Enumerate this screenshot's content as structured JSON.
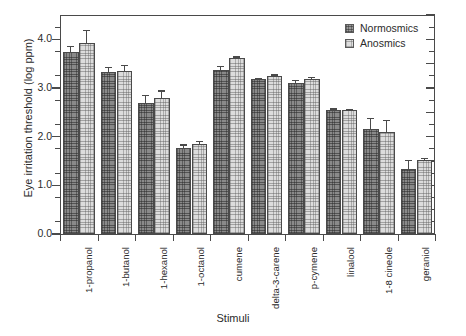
{
  "chart_data": {
    "type": "bar",
    "title": "",
    "xlabel": "Stimuli",
    "ylabel": "Eye irritation threshold (log ppm)",
    "ylim": [
      0.0,
      4.5
    ],
    "yticks": [
      "0.0",
      "1.0",
      "2.0",
      "3.0",
      "4.0"
    ],
    "ytick_values": [
      0.0,
      1.0,
      2.0,
      3.0,
      4.0
    ],
    "grid": false,
    "legend_position": "top-right",
    "categories": [
      "1-propanol",
      "1-butanol",
      "1-hexanol",
      "1-octanol",
      "cumene",
      "delta-3-carene",
      "p-cymene",
      "linalool",
      "1-8 cineole",
      "geraniol"
    ],
    "series": [
      {
        "name": "Normosmics",
        "values": [
          3.73,
          3.32,
          2.7,
          1.77,
          3.38,
          3.18,
          3.11,
          2.54,
          2.16,
          1.34
        ],
        "errors": [
          0.13,
          0.11,
          0.15,
          0.07,
          0.08,
          0.03,
          0.06,
          0.04,
          0.22,
          0.18
        ]
      },
      {
        "name": "Anosmics",
        "values": [
          3.93,
          3.35,
          2.8,
          1.84,
          3.61,
          3.24,
          3.19,
          2.54,
          2.09,
          1.53
        ],
        "errors": [
          0.27,
          0.12,
          0.15,
          0.07,
          0.04,
          0.04,
          0.04,
          0.03,
          0.25,
          0.03
        ]
      }
    ]
  },
  "legend": {
    "entries": [
      {
        "label": "Normosmics"
      },
      {
        "label": "Anosmics"
      }
    ]
  },
  "colors": {
    "normosmics": "#8a8a8a",
    "anosmics": "#dcdcdc",
    "axis": "#4a4a4a",
    "text": "#2b2b2b",
    "background": "#ffffff"
  }
}
